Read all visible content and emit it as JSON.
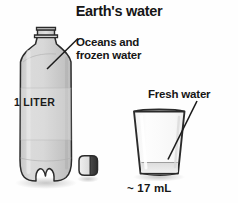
{
  "figure": {
    "title": "Earth's water",
    "background_color": "#fefefe",
    "ink_color": "#161616"
  },
  "labels": {
    "oceans": "Oceans and frozen water",
    "fresh_water": "Fresh water",
    "bottle_volume": "1 LITER",
    "glass_volume": "~ 17 mL"
  },
  "objects": {
    "bottle": {
      "name": "one-liter plastic bottle",
      "represents": "Oceans and frozen water",
      "fill_color": "#d2d2d2",
      "outline_color": "#2b2b2b"
    },
    "cap": {
      "name": "bottle cap",
      "fill_color": "#e8e8e8",
      "shadow_color": "#3a3a3a"
    },
    "glass": {
      "name": "drinking glass",
      "represents": "Fresh water",
      "fill_color": "#fbfbfb",
      "water_color": "#e6e6e6",
      "outline_color": "#2b2b2b"
    }
  },
  "annotations": {
    "oceans_leader": "leader line from Oceans and frozen water label to bottle shoulder",
    "fresh_leader": "leader line from Fresh water label to glass water level"
  }
}
